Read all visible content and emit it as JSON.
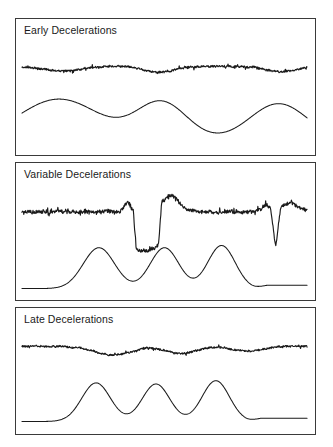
{
  "figure": {
    "background_color": "#ffffff",
    "trace_color": "#1a1a1a",
    "border_color": "#3a3a3a",
    "width": 333,
    "height": 447
  },
  "panels": [
    {
      "id": "early",
      "label": "Early Deceleations",
      "label_text": "Early Decelerations"
    },
    {
      "id": "variable",
      "label": "Variable Decelerations",
      "label_text": "Variable Decelerations"
    },
    {
      "id": "late",
      "label": "Late Decelerations",
      "label_text": "Late Decelerations"
    }
  ],
  "chart_data": {
    "type": "line",
    "xlabel": "",
    "ylabel": "",
    "grid": false,
    "legend": "none",
    "charts": [
      {
        "panel": "early",
        "label": "Early Decelerations",
        "description": "Fetal heart rate decelerations that mirror uterine contractions; nadir coincides with peak of contraction.",
        "series": [
          {
            "name": "fetal-heart-rate",
            "kind": "fhr",
            "baseline": 0.5,
            "noise_amplitude": 0.055,
            "decelerations": [
              {
                "center": 0.14,
                "depth": 0.13,
                "width": 0.11,
                "shape": "gradual-u"
              },
              {
                "center": 0.48,
                "depth": 0.17,
                "width": 0.09,
                "shape": "gradual-u"
              },
              {
                "center": 0.91,
                "depth": 0.15,
                "width": 0.09,
                "shape": "gradual-u"
              }
            ]
          },
          {
            "name": "uterine-contractions",
            "kind": "uc",
            "baseline": 0.12,
            "contractions": [
              {
                "center": 0.13,
                "height": 0.72,
                "width": 0.12,
                "shape": "broad"
              },
              {
                "center": 0.49,
                "height": 0.66,
                "width": 0.075,
                "shape": "broad"
              },
              {
                "center": 0.9,
                "height": 0.64,
                "width": 0.085,
                "shape": "broad"
              }
            ]
          }
        ]
      },
      {
        "panel": "variable",
        "label": "Variable Decelerations",
        "description": "Abrupt, variable-shaped decelerations with shoulders and overshoot; no consistent relationship to contractions.",
        "series": [
          {
            "name": "fetal-heart-rate",
            "kind": "fhr",
            "baseline": 0.38,
            "noise_amplitude": 0.05,
            "decelerations": [
              {
                "center": 0.44,
                "depth": 0.55,
                "width": 0.1,
                "shape": "abrupt-square",
                "shoulder": 0.12,
                "overshoot": 0.22
              },
              {
                "center": 0.89,
                "depth": 0.52,
                "width": 0.035,
                "shape": "abrupt-v",
                "shoulder": 0.1,
                "overshoot": 0.12
              }
            ]
          },
          {
            "name": "uterine-contractions",
            "kind": "uc",
            "baseline": 0.1,
            "contractions": [
              {
                "center": 0.27,
                "height": 0.74,
                "width": 0.055,
                "shape": "sharp"
              },
              {
                "center": 0.5,
                "height": 0.74,
                "width": 0.05,
                "shape": "sharp"
              },
              {
                "center": 0.7,
                "height": 0.78,
                "width": 0.048,
                "shape": "sharp"
              }
            ]
          }
        ]
      },
      {
        "panel": "late",
        "label": "Late Decelerations",
        "description": "Shallow, gradual decelerations whose nadir occurs after the peak of the uterine contraction.",
        "series": [
          {
            "name": "fetal-heart-rate",
            "kind": "fhr",
            "baseline": 0.42,
            "noise_amplitude": 0.045,
            "decelerations": [
              {
                "center": 0.26,
                "depth": 0.22,
                "width": 0.11,
                "shape": "gradual-u",
                "lag": 0.06
              },
              {
                "center": 0.5,
                "depth": 0.18,
                "width": 0.09,
                "shape": "gradual-u",
                "lag": 0.06
              },
              {
                "center": 0.73,
                "depth": 0.12,
                "width": 0.09,
                "shape": "gradual-u",
                "lag": 0.06
              }
            ]
          },
          {
            "name": "uterine-contractions",
            "kind": "uc",
            "baseline": 0.12,
            "contractions": [
              {
                "center": 0.26,
                "height": 0.7,
                "width": 0.05,
                "shape": "sharp"
              },
              {
                "center": 0.47,
                "height": 0.68,
                "width": 0.048,
                "shape": "sharp"
              },
              {
                "center": 0.68,
                "height": 0.74,
                "width": 0.048,
                "shape": "sharp"
              }
            ]
          }
        ]
      }
    ]
  }
}
